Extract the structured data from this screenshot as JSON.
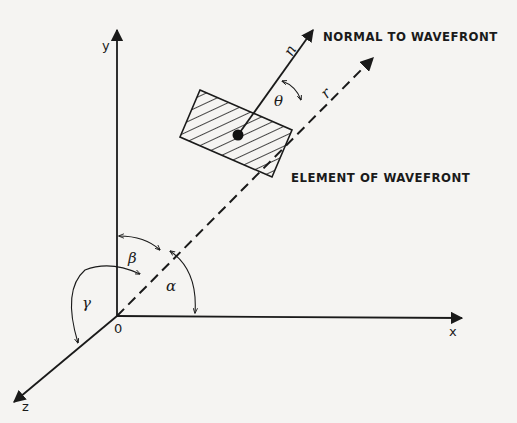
{
  "diagram": {
    "axes": {
      "y_label": "y",
      "x_label": "x",
      "z_label": "z",
      "origin_label": "0"
    },
    "vectors": {
      "normal_label": "n",
      "r_label": "r"
    },
    "angles": {
      "theta": "θ",
      "alpha": "α",
      "beta": "β",
      "gamma": "γ"
    },
    "annotations": {
      "normal": "NORMAL TO WAVEFRONT",
      "element": "ELEMENT OF WAVEFRONT"
    },
    "colors": {
      "ink": "#1a1a1a",
      "paper": "#f5f4f2"
    }
  }
}
